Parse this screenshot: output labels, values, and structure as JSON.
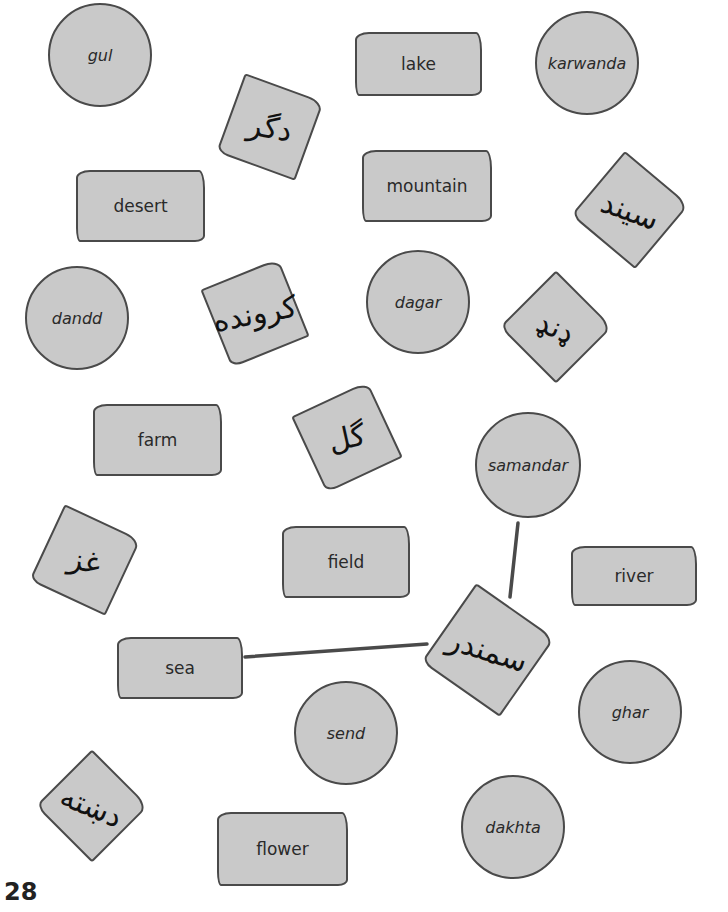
{
  "page": {
    "number": "28",
    "colors": {
      "shape_fill": "#c9c9c9",
      "shape_stroke": "#4a4a4a",
      "background": "#ffffff",
      "text": "#2a2a2a"
    }
  },
  "circles": [
    {
      "label": "gul",
      "cx": 100,
      "cy": 55,
      "r": 52
    },
    {
      "label": "karwanda",
      "cx": 587,
      "cy": 63,
      "r": 52
    },
    {
      "label": "dandd",
      "cx": 77,
      "cy": 318,
      "r": 52
    },
    {
      "label": "dagar",
      "cx": 418,
      "cy": 302,
      "r": 52
    },
    {
      "label": "samandar",
      "cx": 528,
      "cy": 465,
      "r": 53
    },
    {
      "label": "ghar",
      "cx": 630,
      "cy": 712,
      "r": 52
    },
    {
      "label": "send",
      "cx": 346,
      "cy": 733,
      "r": 52
    },
    {
      "label": "dakhta",
      "cx": 513,
      "cy": 827,
      "r": 52
    }
  ],
  "rects": [
    {
      "label": "lake",
      "x": 355,
      "y": 32,
      "w": 127,
      "h": 64
    },
    {
      "label": "desert",
      "x": 76,
      "y": 170,
      "w": 129,
      "h": 72
    },
    {
      "label": "mountain",
      "x": 362,
      "y": 150,
      "w": 130,
      "h": 72
    },
    {
      "label": "farm",
      "x": 93,
      "y": 404,
      "w": 129,
      "h": 72
    },
    {
      "label": "field",
      "x": 282,
      "y": 526,
      "w": 128,
      "h": 72
    },
    {
      "label": "river",
      "x": 571,
      "y": 546,
      "w": 126,
      "h": 60
    },
    {
      "label": "sea",
      "x": 117,
      "y": 637,
      "w": 126,
      "h": 62
    },
    {
      "label": "flower",
      "x": 217,
      "y": 812,
      "w": 131,
      "h": 74
    }
  ],
  "squares": [
    {
      "label": "دگر",
      "cx": 270,
      "cy": 127,
      "size": 84,
      "rotate": 20
    },
    {
      "label": "سیند",
      "cx": 630,
      "cy": 210,
      "size": 84,
      "rotate": 40
    },
    {
      "label": "کرونده",
      "cx": 255,
      "cy": 313,
      "size": 84,
      "rotate": -22
    },
    {
      "label": "ډنډ",
      "cx": 556,
      "cy": 327,
      "size": 80,
      "rotate": 45
    },
    {
      "label": "گل",
      "cx": 347,
      "cy": 437,
      "size": 84,
      "rotate": -25
    },
    {
      "label": "غز",
      "cx": 85,
      "cy": 560,
      "size": 84,
      "rotate": 25
    },
    {
      "label": "سمندر",
      "cx": 488,
      "cy": 650,
      "size": 96,
      "rotate": 35
    },
    {
      "label": "دښته",
      "cx": 92,
      "cy": 806,
      "size": 80,
      "rotate": 45
    }
  ],
  "connections": [
    {
      "from": "samandar",
      "to": "سمندر",
      "x1": 518,
      "y1": 523,
      "x2": 510,
      "y2": 597
    },
    {
      "from": "sea",
      "to": "سمندر",
      "x1": 245,
      "y1": 657,
      "x2": 427,
      "y2": 644
    }
  ]
}
